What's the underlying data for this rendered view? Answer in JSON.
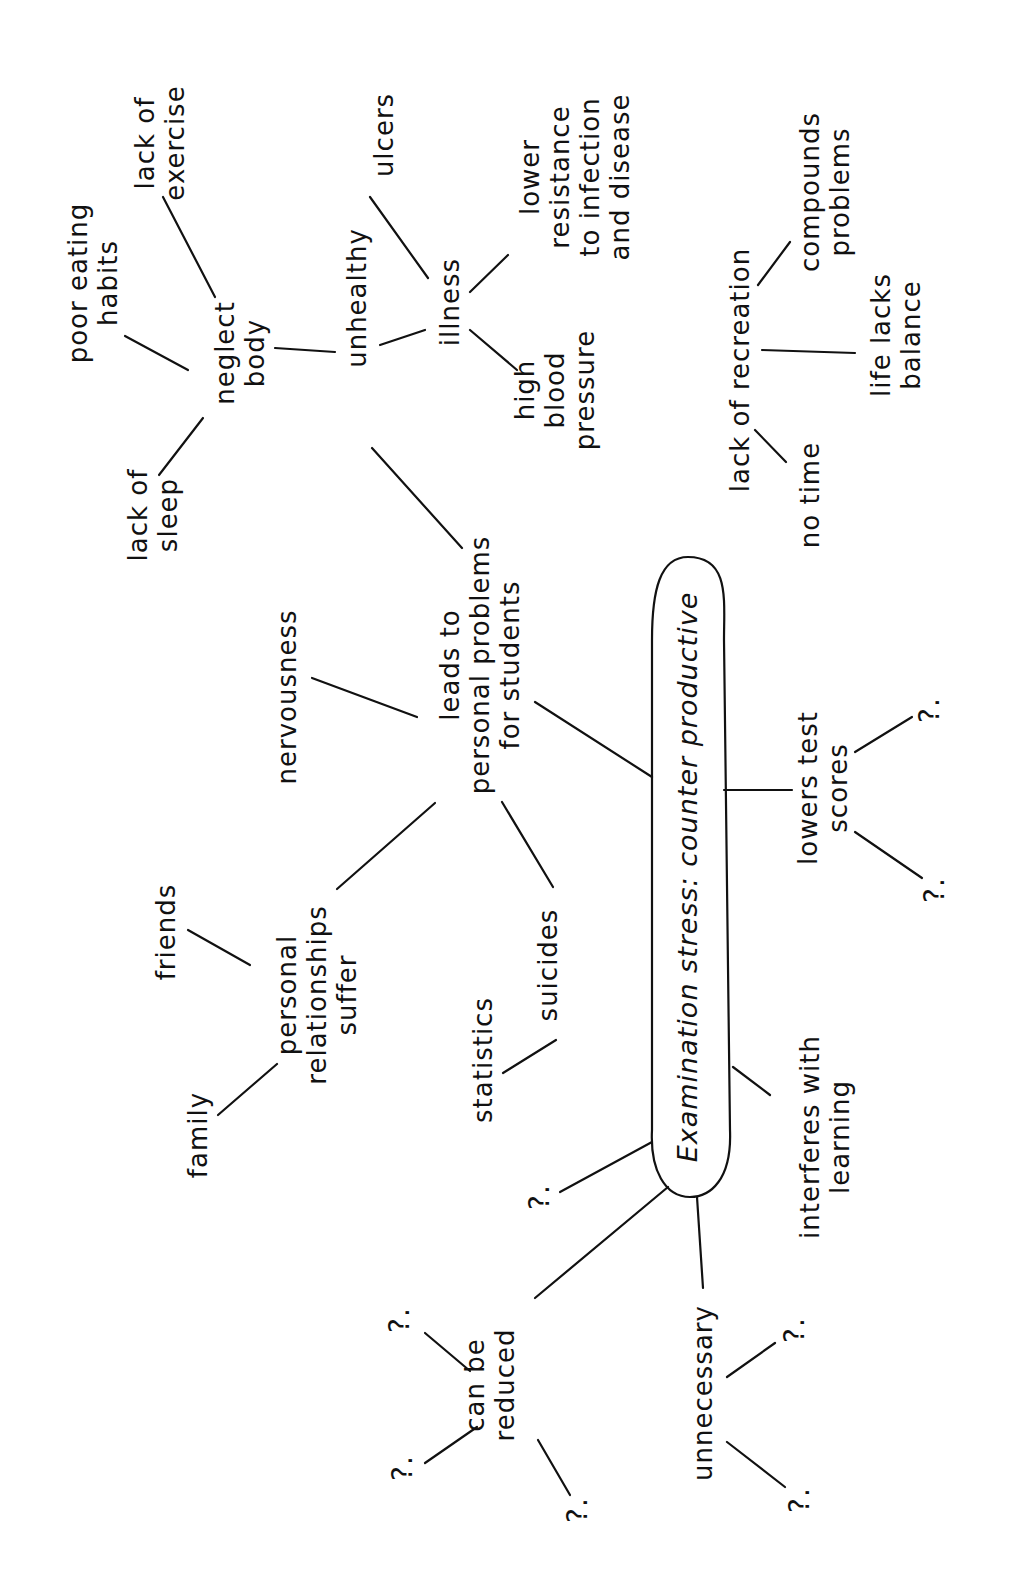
{
  "title": "Examination stress: counter productive",
  "colors": {
    "ink": "#111111",
    "background": "#ffffff"
  },
  "central": {
    "label": "Examination stress: counter productive"
  },
  "nodes": {
    "leads_to": "leads to\npersonal problems\nfor students",
    "nervousness": "nervousness",
    "personal_relationships": "personal\nrelationships\nsuffer",
    "friends": "friends",
    "family": "family",
    "suicides": "suicides",
    "statistics": "statistics",
    "unhealthy": "unhealthy",
    "neglect_body": "neglect\nbody",
    "lack_of_sleep": "lack of\nsleep",
    "poor_eating": "poor eating\nhabits",
    "lack_of_exercise": "lack of\nexercise",
    "illness": "illness",
    "ulcers": "ulcers",
    "lower_resistance": "lower\nresistance\nto infection\nand disease",
    "high_blood_pressure": "high\nblood\npressure",
    "lack_of_recreation": "lack of recreation",
    "no_time": "no time",
    "life_lacks_balance": "life lacks\nbalance",
    "compounds_problems": "compounds\nproblems",
    "lowers_test_scores": "lowers test\nscores",
    "interferes_with_learning": "interferes with\nlearning",
    "unnecessary": "unnecessary",
    "can_be_reduced": "can be\nreduced",
    "question": "?."
  }
}
